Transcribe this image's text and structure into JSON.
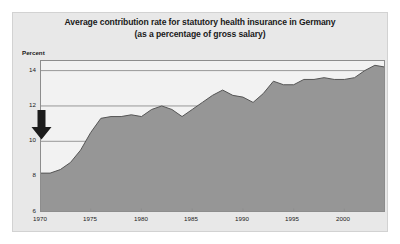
{
  "chart_data": {
    "type": "area",
    "title": "Average contribution rate for statutory health insurance in Germany",
    "subtitle": "(as a percentage of gross salary)",
    "xlabel": "",
    "ylabel": "Percent",
    "ylim": [
      6,
      14.6
    ],
    "xlim": [
      1970,
      2004
    ],
    "grid": true,
    "legend": null,
    "yticks": [
      "6",
      "8",
      "10",
      "12",
      "14"
    ],
    "ytick_values": [
      6,
      8,
      10,
      12,
      14
    ],
    "xticks": [
      "1970",
      "1975",
      "1980",
      "1985",
      "1990",
      "1995",
      "2000"
    ],
    "xtick_values": [
      1970,
      1975,
      1980,
      1985,
      1990,
      1995,
      2000
    ],
    "x": [
      1970,
      1971,
      1972,
      1973,
      1974,
      1975,
      1976,
      1977,
      1978,
      1979,
      1980,
      1981,
      1982,
      1983,
      1984,
      1985,
      1986,
      1987,
      1988,
      1989,
      1990,
      1991,
      1992,
      1993,
      1994,
      1995,
      1996,
      1997,
      1998,
      1999,
      2000,
      2001,
      2002,
      2003,
      2004
    ],
    "values": [
      8.2,
      8.2,
      8.4,
      8.8,
      9.5,
      10.5,
      11.3,
      11.4,
      11.4,
      11.5,
      11.4,
      11.8,
      12.0,
      11.8,
      11.4,
      11.8,
      12.2,
      12.6,
      12.9,
      12.6,
      12.5,
      12.2,
      12.7,
      13.4,
      13.2,
      13.2,
      13.5,
      13.5,
      13.6,
      13.5,
      13.5,
      13.6,
      14.0,
      14.3,
      14.2
    ],
    "series_name": "Average contribution rate",
    "annotations": [
      {
        "name": "down-arrow",
        "shape": "solid-down-arrow",
        "x": 1970.5,
        "y": 10.9
      }
    ],
    "colors": {
      "area_fill": "#969696",
      "line": "#555555",
      "grid": "#8d8d8d",
      "panel_background": "#e8e8e8",
      "plot_background": "#f2f2f2",
      "text": "#1a1a1a",
      "arrow": "#1c1c1c"
    }
  }
}
